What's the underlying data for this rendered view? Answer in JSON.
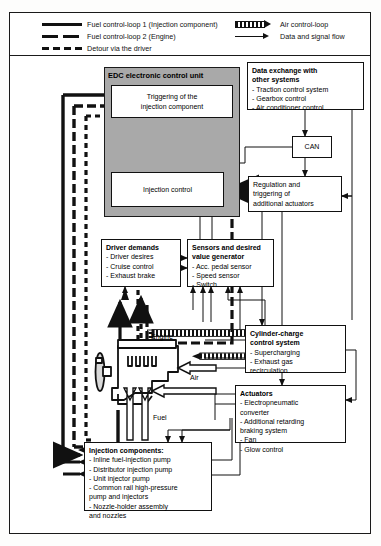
{
  "legend": {
    "items": [
      {
        "icon": "solid-thick-line-icon",
        "label": "Fuel control-loop 1 (Injection component)"
      },
      {
        "icon": "long-dashed-thick-line-icon",
        "label": "Fuel control-loop 2 (Engine)"
      },
      {
        "icon": "short-dashed-thick-line-icon",
        "label": "Detour via the driver"
      },
      {
        "icon": "hatched-arrow-icon",
        "label": "Air control-loop"
      },
      {
        "icon": "thin-arrow-icon",
        "label": "Data and signal flow"
      }
    ]
  },
  "edc": {
    "title": "EDC electronic control unit",
    "triggering": {
      "line1": "Triggering of the",
      "line2": "injection component"
    },
    "injection_control": {
      "label": "Injection control"
    },
    "can": {
      "label": "CAN"
    }
  },
  "data_exchange": {
    "title_line1": "Data exchange with",
    "title_line2": "other systems",
    "items": [
      "- Traction control system",
      "- Gearbox control",
      "- Air conditioner control"
    ]
  },
  "regulation": {
    "line1": "Regulation and",
    "line2": "triggering of",
    "line3": "additional actuators"
  },
  "driver_demands": {
    "title": "Driver demands",
    "items": [
      "- Driver desires",
      "- Cruise control",
      "- Exhaust brake"
    ]
  },
  "sensors": {
    "title_line1": "Sensors and desired",
    "title_line2": "value generator",
    "items": [
      "- Acc. pedal sensor",
      "- Speed sensor",
      "- Switch"
    ]
  },
  "cylinder_charge": {
    "title_line1": "Cylinder-charge",
    "title_line2": "control system",
    "items": [
      "- Supercharging",
      "- Exhaust gas",
      "   recirculation"
    ]
  },
  "actuators": {
    "title": "Actuators",
    "items": [
      "- Electropneumatic",
      "   converter",
      "- Additional retarding",
      "   braking system",
      "- Fan",
      "- Glow control"
    ]
  },
  "injection_components": {
    "title": "Injection components:",
    "items": [
      "- Inline fuel-injection pump",
      "- Distributor injection pump",
      "- Unit injector pump",
      "- Common rail high-pressure",
      "   pump and injectors",
      "- Nozzle-holder assembly",
      "   and nozzles"
    ]
  },
  "schematic_labels": {
    "engine": "Engine",
    "air": "Air",
    "fuel": "Fuel"
  },
  "colors": {
    "panel_grey": "#a9a9a9",
    "line": "#111111",
    "background": "#ffffff"
  }
}
